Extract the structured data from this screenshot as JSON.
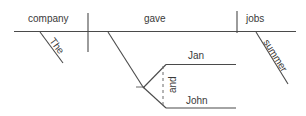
{
  "diagram": {
    "type": "reed-kellogg-sentence-diagram",
    "sentence": "The company gave Jan and John summer jobs.",
    "canvas": {
      "width": 306,
      "height": 116
    },
    "colors": {
      "background": "#ffffff",
      "line": "#4a4a4a",
      "thin_line": "#6b6b6b",
      "text": "#3a3a3a"
    },
    "words": {
      "subject": "company",
      "subject_article": "The",
      "verb": "gave",
      "direct_object": "jobs",
      "object_modifier": "summer",
      "indirect_object_a": "Jan",
      "conjunction": "and",
      "indirect_object_b": "John"
    },
    "labels": [
      {
        "id": "subject",
        "text": "company",
        "x": 28,
        "y": 22,
        "rotation": 0
      },
      {
        "id": "subject-article",
        "text": "The",
        "x": 49,
        "y": 41,
        "rotation": 53
      },
      {
        "id": "verb",
        "text": "gave",
        "x": 144,
        "y": 22,
        "rotation": 0
      },
      {
        "id": "direct-object",
        "text": "jobs",
        "x": 246,
        "y": 22,
        "rotation": 0
      },
      {
        "id": "object-modifier",
        "text": "summer",
        "x": 263,
        "y": 42,
        "rotation": 58
      },
      {
        "id": "indirect-object-a",
        "text": "Jan",
        "x": 188,
        "y": 59,
        "rotation": 0
      },
      {
        "id": "conjunction",
        "text": "and",
        "x": 176,
        "y": 93,
        "rotation": -90
      },
      {
        "id": "indirect-object-b",
        "text": "John",
        "x": 186,
        "y": 104,
        "rotation": 0
      }
    ],
    "strokes": [
      {
        "id": "main-baseline",
        "kind": "line",
        "x1": 14,
        "y1": 31.5,
        "x2": 296,
        "y2": 31.5
      },
      {
        "id": "subject-verb-divider",
        "kind": "line",
        "x1": 88,
        "y1": 13,
        "x2": 88,
        "y2": 52
      },
      {
        "id": "verb-object-divider",
        "kind": "line",
        "x1": 237,
        "y1": 11,
        "x2": 237,
        "y2": 33
      },
      {
        "id": "article-slant",
        "kind": "line",
        "x1": 40,
        "y1": 32,
        "x2": 63,
        "y2": 63
      },
      {
        "id": "object-modifier-slant",
        "kind": "line",
        "x1": 256,
        "y1": 32,
        "x2": 288,
        "y2": 84
      },
      {
        "id": "indirect-object-stem",
        "kind": "line",
        "x1": 108,
        "y1": 32,
        "x2": 143,
        "y2": 87
      },
      {
        "id": "fork-stub",
        "kind": "line",
        "x1": 136,
        "y1": 87,
        "x2": 145,
        "y2": 87
      },
      {
        "id": "fork-upper-branch",
        "kind": "line",
        "x1": 143,
        "y1": 88,
        "x2": 166,
        "y2": 64.5
      },
      {
        "id": "fork-lower-branch",
        "kind": "line",
        "x1": 143,
        "y1": 87,
        "x2": 166,
        "y2": 108
      },
      {
        "id": "jan-baseline",
        "kind": "line",
        "x1": 166,
        "y1": 64.5,
        "x2": 236,
        "y2": 64.5
      },
      {
        "id": "john-baseline",
        "kind": "line",
        "x1": 166,
        "y1": 108,
        "x2": 236,
        "y2": 108
      },
      {
        "id": "conjunction-connector",
        "kind": "dashed",
        "x1": 163,
        "y1": 66,
        "x2": 163,
        "y2": 107
      }
    ]
  }
}
